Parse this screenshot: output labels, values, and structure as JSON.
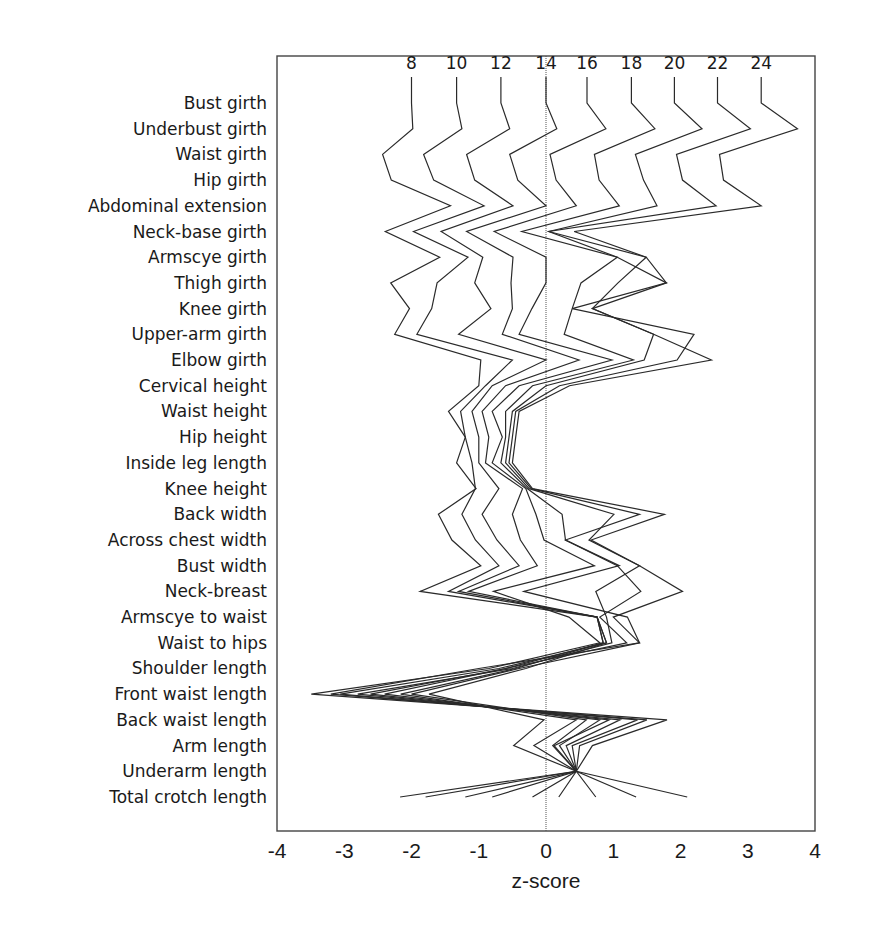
{
  "chart_data": {
    "type": "line",
    "orientation": "horizontal-profile",
    "title": "",
    "xlabel": "z-score",
    "ylabel": "",
    "xlim": [
      -4,
      4
    ],
    "x_ticks": [
      "-4",
      "-3",
      "-2",
      "-1",
      "0",
      "1",
      "2",
      "3",
      "4"
    ],
    "grid": false,
    "reference_line": {
      "x": 0,
      "style": "dotted"
    },
    "legend": "series labels placed above each line start (sizes)",
    "categories": [
      "Bust girth",
      "Underbust girth",
      "Waist girth",
      "Hip girth",
      "Abdominal extension",
      "Neck-base girth",
      "Armscye girth",
      "Thigh girth",
      "Knee girth",
      "Upper-arm girth",
      "Elbow girth",
      "Cervical height",
      "Waist height",
      "Hip height",
      "Inside leg length",
      "Knee height",
      "Back width",
      "Across chest width",
      "Bust width",
      "Neck-breast",
      "Armscye to waist",
      "Waist to hips",
      "Shoulder length",
      "Front waist length",
      "Back waist length",
      "Arm length",
      "Underarm length",
      "Total crotch length"
    ],
    "series": [
      {
        "name": "8",
        "values": [
          -2.0,
          -1.98,
          -2.43,
          -2.3,
          -1.42,
          -2.39,
          -1.58,
          -2.31,
          -2.03,
          -2.25,
          -0.97,
          -1.0,
          -1.45,
          -1.2,
          -1.33,
          -1.04,
          -1.6,
          -1.4,
          -0.97,
          -1.87,
          0.76,
          0.9,
          -0.3,
          -1.74,
          -0.03,
          -0.48,
          0.45,
          -2.17
        ]
      },
      {
        "name": "10",
        "values": [
          -1.33,
          -1.25,
          -1.82,
          -1.67,
          -0.92,
          -1.97,
          -1.16,
          -1.62,
          -1.7,
          -1.92,
          -0.5,
          -0.9,
          -1.27,
          -1.2,
          -1.1,
          -1.05,
          -1.25,
          -1.05,
          -0.7,
          -1.45,
          0.76,
          0.85,
          -0.45,
          -2.16,
          0.45,
          -0.18,
          0.45,
          -1.79
        ]
      },
      {
        "name": "12",
        "values": [
          -0.67,
          -0.54,
          -1.18,
          -1.06,
          -0.49,
          -1.56,
          -0.94,
          -1.06,
          -0.82,
          -1.3,
          0.0,
          -0.8,
          -1.1,
          -1.0,
          -1.0,
          -0.7,
          -0.95,
          -0.73,
          -0.4,
          -1.3,
          0.76,
          0.85,
          -0.6,
          -2.61,
          0.94,
          0.12,
          0.45,
          -1.2
        ]
      },
      {
        "name": "14",
        "values": [
          0.0,
          0.16,
          -0.54,
          -0.42,
          0.0,
          -1.18,
          -0.49,
          -0.52,
          -0.5,
          -0.65,
          0.49,
          -0.6,
          -0.95,
          -0.85,
          -0.9,
          -0.35,
          -0.5,
          -0.38,
          -0.13,
          -1.15,
          0.76,
          0.9,
          -0.7,
          -3.06,
          1.36,
          0.39,
          0.45,
          -0.8
        ]
      },
      {
        "name": "16",
        "values": [
          0.61,
          0.89,
          0.06,
          0.15,
          0.45,
          -0.77,
          0.0,
          0.0,
          -0.21,
          -0.4,
          0.98,
          -0.4,
          -0.8,
          -0.65,
          -0.8,
          -0.3,
          -0.15,
          -0.03,
          0.72,
          -0.78,
          0.34,
          0.8,
          -0.85,
          -3.49,
          1.8,
          0.69,
          0.45,
          -0.2
        ]
      },
      {
        "name": "18",
        "values": [
          1.27,
          1.62,
          0.72,
          0.79,
          1.09,
          -0.36,
          1.06,
          0.52,
          0.39,
          0.27,
          1.3,
          -0.2,
          -0.6,
          -0.6,
          -0.67,
          -0.28,
          0.24,
          0.29,
          1.09,
          -0.33,
          1.21,
          1.39,
          -1.0,
          -3.2,
          1.5,
          0.5,
          0.45,
          0.19
        ]
      },
      {
        "name": "20",
        "values": [
          1.91,
          2.32,
          1.33,
          1.45,
          1.65,
          0.04,
          1.49,
          1.07,
          0.69,
          1.6,
          1.46,
          0.0,
          -0.5,
          -0.55,
          -0.6,
          -0.25,
          1.01,
          0.64,
          1.39,
          0.74,
          0.9,
          0.98,
          -0.5,
          -2.8,
          1.1,
          0.3,
          0.45,
          0.74
        ]
      },
      {
        "name": "22",
        "values": [
          2.55,
          3.04,
          1.94,
          2.03,
          2.53,
          0.04,
          1.06,
          1.79,
          0.39,
          2.2,
          1.95,
          0.2,
          -0.45,
          -0.5,
          -0.55,
          -0.22,
          1.39,
          0.29,
          1.06,
          1.41,
          0.8,
          1.2,
          -0.6,
          -2.4,
          0.8,
          0.2,
          0.45,
          1.34
        ]
      },
      {
        "name": "24",
        "values": [
          3.2,
          3.74,
          2.58,
          2.64,
          3.2,
          0.42,
          1.49,
          1.79,
          0.69,
          1.6,
          2.46,
          0.35,
          -0.4,
          -0.45,
          -0.5,
          -0.2,
          1.76,
          0.67,
          1.39,
          2.03,
          1.0,
          1.39,
          -0.4,
          -2.0,
          0.6,
          0.1,
          0.45,
          2.1
        ]
      }
    ]
  }
}
